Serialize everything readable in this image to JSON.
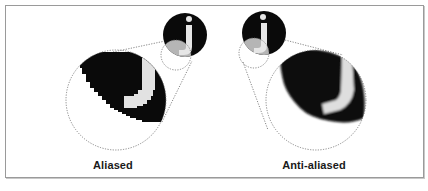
{
  "figure": {
    "panels": [
      {
        "id": "aliased",
        "label": "Aliased",
        "edge": "jagged"
      },
      {
        "id": "anti-aliased",
        "label": "Anti-aliased",
        "edge": "smooth"
      }
    ],
    "glyph": "j",
    "colors": {
      "ink": "#0a0a0a",
      "highlight": "#b5b5b5",
      "glyph_fill": "#e6e6e6",
      "dashed_outline": "#6a6a6a",
      "frame_border": "#9a9a9a",
      "background": "#ffffff"
    }
  }
}
